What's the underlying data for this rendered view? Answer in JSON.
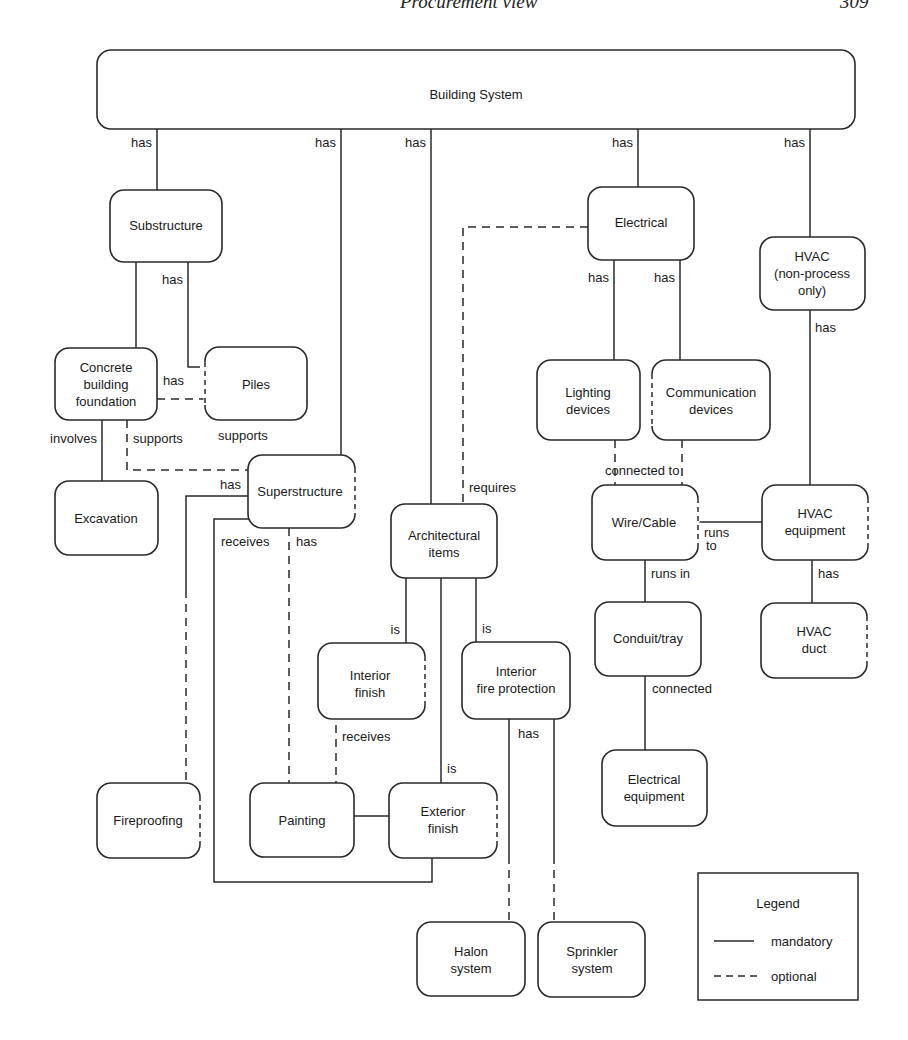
{
  "header": {
    "running_title": "Procurement view",
    "page_number": "309"
  },
  "diagram": {
    "title_node": "Building System",
    "nodes": {
      "substructure": [
        "Substructure"
      ],
      "concrete_foundation": [
        "Concrete",
        "building",
        "foundation"
      ],
      "piles": [
        "Piles"
      ],
      "excavation": [
        "Excavation"
      ],
      "superstructure": [
        "Superstructure"
      ],
      "electrical": [
        "Electrical"
      ],
      "hvac_nonprocess": [
        "HVAC",
        "(non-process",
        "only)"
      ],
      "lighting": [
        "Lighting",
        "devices"
      ],
      "communication": [
        "Communication",
        "devices"
      ],
      "wire_cable": [
        "Wire/Cable"
      ],
      "hvac_equipment": [
        "HVAC",
        "equipment"
      ],
      "architectural": [
        "Architectural",
        "items"
      ],
      "conduit_tray": [
        "Conduit/tray"
      ],
      "hvac_duct": [
        "HVAC",
        "duct"
      ],
      "interior_finish": [
        "Interior",
        "finish"
      ],
      "interior_fire": [
        "Interior",
        "fire protection"
      ],
      "electrical_equipment": [
        "Electrical",
        "equipment"
      ],
      "fireproofing": [
        "Fireproofing"
      ],
      "painting": [
        "Painting"
      ],
      "exterior_finish": [
        "Exterior",
        "finish"
      ],
      "halon": [
        "Halon",
        "system"
      ],
      "sprinkler": [
        "Sprinkler",
        "system"
      ]
    },
    "edge_labels": {
      "bs_substructure": "has",
      "bs_superstructure": "has",
      "bs_architectural": "has",
      "bs_electrical": "has",
      "bs_hvac": "has",
      "sub_piles": "has",
      "found_piles": "has",
      "found_excavation": "involves",
      "found_super": "supports",
      "piles_super": "supports",
      "super_fireproofing": "has",
      "super_receives": "receives",
      "super_painting": "has",
      "arch_requires": "requires",
      "elec_lighting": "has",
      "elec_comm": "has",
      "hvac_equipment": "has",
      "connected_to": "connected to",
      "runs_to_1": "runs",
      "runs_to_2": "to",
      "runs_in": "runs in",
      "equip_duct": "has",
      "arch_interior": "is",
      "arch_fire": "is",
      "arch_exterior": "is",
      "conduit_equipment": "connected",
      "interior_receives": "receives",
      "fire_has": "has"
    },
    "legend": {
      "title": "Legend",
      "mandatory": "mandatory",
      "optional": "optional"
    }
  }
}
